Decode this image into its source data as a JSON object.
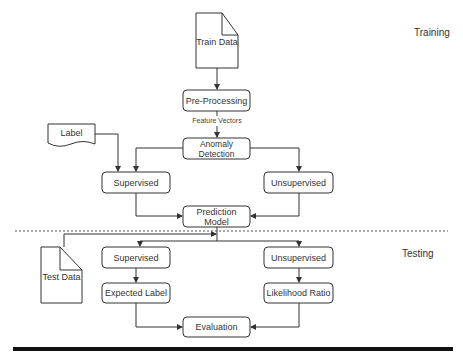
{
  "diagram": {
    "sections": {
      "training": "Training",
      "testing": "Testing"
    },
    "nodes": {
      "train_data": "Train Data",
      "pre_processing": "Pre-Processing",
      "anomaly_detection": "Anomaly Detection",
      "label": "Label",
      "supervised_train": "Supervised",
      "unsupervised_train": "Unsupervised",
      "prediction_model": "Prediction Model",
      "test_data": "Test Data",
      "supervised_test": "Supervised",
      "unsupervised_test": "Unsupervised",
      "expected_label": "Expected Label",
      "likelihood_ratio": "Likelihood Ratio",
      "evaluation": "Evaluation"
    },
    "edge_labels": {
      "feature_vectors": "Feature Vectors"
    },
    "edges": [
      [
        "Train Data",
        "Pre-Processing"
      ],
      [
        "Pre-Processing",
        "Anomaly Detection",
        "Feature Vectors"
      ],
      [
        "Anomaly Detection",
        "Supervised"
      ],
      [
        "Anomaly Detection",
        "Unsupervised"
      ],
      [
        "Label",
        "Supervised"
      ],
      [
        "Supervised",
        "Prediction Model"
      ],
      [
        "Unsupervised",
        "Prediction Model"
      ],
      [
        "Test Data",
        "Prediction Model"
      ],
      [
        "Prediction Model",
        "Supervised (test)"
      ],
      [
        "Prediction Model",
        "Unsupervised (test)"
      ],
      [
        "Supervised (test)",
        "Expected Label"
      ],
      [
        "Unsupervised (test)",
        "Likelihood Ratio"
      ],
      [
        "Expected Label",
        "Evaluation"
      ],
      [
        "Likelihood Ratio",
        "Evaluation"
      ]
    ],
    "colors": {
      "stroke": "#333333",
      "divider": "#555555",
      "bar": "#111111"
    }
  }
}
